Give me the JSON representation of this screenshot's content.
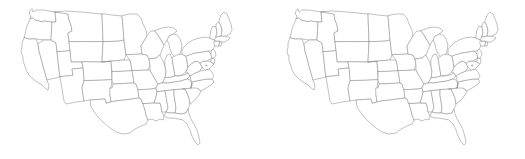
{
  "page": {
    "background_color": "#ffffff",
    "width": 525,
    "height": 159,
    "panel_count": 2
  },
  "style": {
    "outline_color": "#8d8d8d",
    "fill_color": "#ffffff",
    "stroke_width": 0.55
  },
  "panels": [
    {
      "id": "left",
      "title": "",
      "map_name": "united-states-contiguous",
      "projection": "albers-usa"
    },
    {
      "id": "right",
      "title": "",
      "map_name": "united-states-contiguous",
      "projection": "albers-usa"
    }
  ],
  "map": {
    "name": "United States (contiguous) state outlines",
    "region_count": 49,
    "regions": [
      {
        "code": "WA",
        "name": "Washington"
      },
      {
        "code": "OR",
        "name": "Oregon"
      },
      {
        "code": "CA",
        "name": "California"
      },
      {
        "code": "NV",
        "name": "Nevada"
      },
      {
        "code": "ID",
        "name": "Idaho"
      },
      {
        "code": "MT",
        "name": "Montana"
      },
      {
        "code": "WY",
        "name": "Wyoming"
      },
      {
        "code": "UT",
        "name": "Utah"
      },
      {
        "code": "AZ",
        "name": "Arizona"
      },
      {
        "code": "CO",
        "name": "Colorado"
      },
      {
        "code": "NM",
        "name": "New Mexico"
      },
      {
        "code": "ND",
        "name": "North Dakota"
      },
      {
        "code": "SD",
        "name": "South Dakota"
      },
      {
        "code": "NE",
        "name": "Nebraska"
      },
      {
        "code": "KS",
        "name": "Kansas"
      },
      {
        "code": "OK",
        "name": "Oklahoma"
      },
      {
        "code": "TX",
        "name": "Texas"
      },
      {
        "code": "MN",
        "name": "Minnesota"
      },
      {
        "code": "IA",
        "name": "Iowa"
      },
      {
        "code": "MO",
        "name": "Missouri"
      },
      {
        "code": "AR",
        "name": "Arkansas"
      },
      {
        "code": "LA",
        "name": "Louisiana"
      },
      {
        "code": "WI",
        "name": "Wisconsin"
      },
      {
        "code": "IL",
        "name": "Illinois"
      },
      {
        "code": "MI",
        "name": "Michigan"
      },
      {
        "code": "IN",
        "name": "Indiana"
      },
      {
        "code": "OH",
        "name": "Ohio"
      },
      {
        "code": "KY",
        "name": "Kentucky"
      },
      {
        "code": "TN",
        "name": "Tennessee"
      },
      {
        "code": "MS",
        "name": "Mississippi"
      },
      {
        "code": "AL",
        "name": "Alabama"
      },
      {
        "code": "GA",
        "name": "Georgia"
      },
      {
        "code": "FL",
        "name": "Florida"
      },
      {
        "code": "SC",
        "name": "South Carolina"
      },
      {
        "code": "NC",
        "name": "North Carolina"
      },
      {
        "code": "VA",
        "name": "Virginia"
      },
      {
        "code": "WV",
        "name": "West Virginia"
      },
      {
        "code": "MD",
        "name": "Maryland"
      },
      {
        "code": "DE",
        "name": "Delaware"
      },
      {
        "code": "PA",
        "name": "Pennsylvania"
      },
      {
        "code": "NJ",
        "name": "New Jersey"
      },
      {
        "code": "NY",
        "name": "New York"
      },
      {
        "code": "CT",
        "name": "Connecticut"
      },
      {
        "code": "RI",
        "name": "Rhode Island"
      },
      {
        "code": "MA",
        "name": "Massachusetts"
      },
      {
        "code": "VT",
        "name": "Vermont"
      },
      {
        "code": "NH",
        "name": "New Hampshire"
      },
      {
        "code": "ME",
        "name": "Maine"
      },
      {
        "code": "DC",
        "name": "District of Columbia"
      }
    ]
  }
}
